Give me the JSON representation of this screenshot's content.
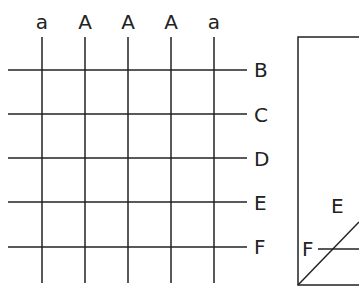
{
  "diagram": {
    "column_labels": [
      "a",
      "A",
      "A",
      "A",
      "a"
    ],
    "row_labels": [
      "B",
      "C",
      "D",
      "E",
      "F"
    ],
    "inset": {
      "labels": [
        "E",
        "F"
      ]
    },
    "colors": {
      "line": "#222222",
      "background": "#ffffff"
    }
  }
}
